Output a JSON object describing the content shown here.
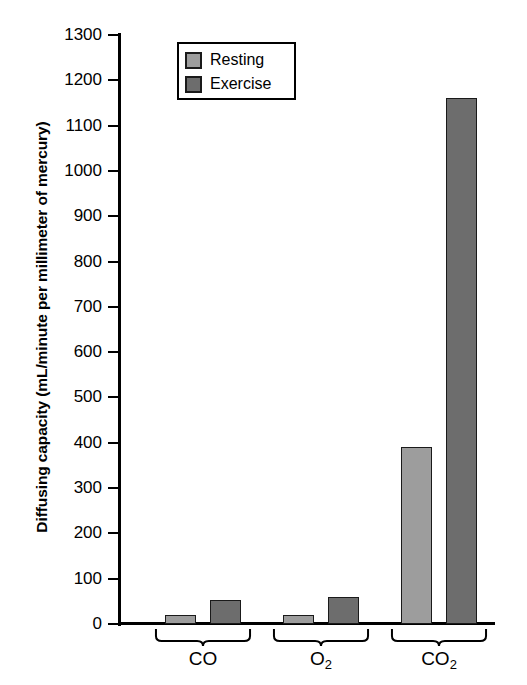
{
  "chart_data": {
    "type": "bar",
    "title": "",
    "xlabel": "",
    "ylabel": "Diffusing capacity (mL/minute per millimeter of mercury)",
    "categories": [
      "CO",
      "O2",
      "CO2"
    ],
    "category_labels_html": [
      "CO",
      "O<sub>2</sub>",
      "CO<sub>2</sub>"
    ],
    "series": [
      {
        "name": "Resting",
        "values": [
          20,
          20,
          390
        ],
        "color": "#9d9d9d"
      },
      {
        "name": "Exercise",
        "values": [
          52,
          60,
          1160
        ],
        "color": "#6d6d6d"
      }
    ],
    "ylim": [
      0,
      1300
    ],
    "ytick_step": 100,
    "yticks": [
      0,
      100,
      200,
      300,
      400,
      500,
      600,
      700,
      800,
      900,
      1000,
      1100,
      1200,
      1300
    ],
    "ytick_labels": [
      "0",
      "100",
      "200",
      "300",
      "400",
      "500",
      "600",
      "700",
      "800",
      "900",
      "1000",
      "1100",
      "1200",
      "1300"
    ],
    "grid": false,
    "legend_position": "top-center",
    "legend_entries": [
      "Resting",
      "Exercise"
    ]
  },
  "legend": {
    "rows": [
      {
        "label": "Resting",
        "swatch": "resting-swatch"
      },
      {
        "label": "Exercise",
        "swatch": "exercise-swatch"
      }
    ]
  },
  "axis": {
    "y_title": "Diffusing capacity (mL/minute per millimeter of mercury)"
  },
  "colors": {
    "resting": "#9d9d9d",
    "exercise": "#6d6d6d",
    "axis": "#000000",
    "background": "#ffffff"
  }
}
